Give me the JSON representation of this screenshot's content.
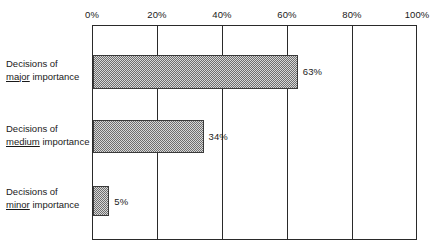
{
  "chart_data": {
    "type": "bar",
    "orientation": "horizontal",
    "title": "",
    "xlabel": "",
    "ylabel": "",
    "xlim": [
      0,
      100
    ],
    "grid": true,
    "legend": null,
    "axis_position": "top",
    "categories": [
      "Decisions of major importance",
      "Decisions of medium importance",
      "Decisions of minor importance"
    ],
    "values": [
      63,
      34,
      5
    ],
    "value_labels": [
      "63%",
      "34%",
      "5%"
    ],
    "tick_labels": [
      "0%",
      "20%",
      "40%",
      "60%",
      "80%",
      "100%"
    ],
    "tick_values": [
      0,
      20,
      40,
      60,
      80,
      100
    ],
    "colors": {
      "bar_fill": "#999999",
      "bar_border": "#3a3a3a",
      "axis": "#2a2a2a",
      "text": "#1a1a1a",
      "background": "#ffffff"
    }
  },
  "category_label_parts": [
    {
      "line1": "Decisions of",
      "emph": "major",
      "rest": " importance"
    },
    {
      "line1": "Decisions of",
      "emph": "medium",
      "rest": " importance"
    },
    {
      "line1": "Decisions of",
      "emph": "minor",
      "rest": " importance"
    }
  ]
}
